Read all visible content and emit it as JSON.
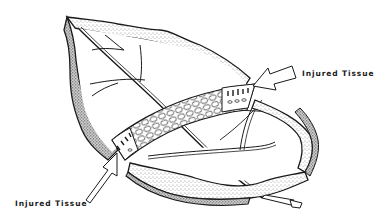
{
  "diagram": {
    "labels": {
      "upper_right": "Injured Tissue",
      "lower_left": "Injured Tissue"
    },
    "colors": {
      "ink": "#1a1a1a",
      "paper": "#ffffff",
      "stipple": "#555555"
    }
  }
}
